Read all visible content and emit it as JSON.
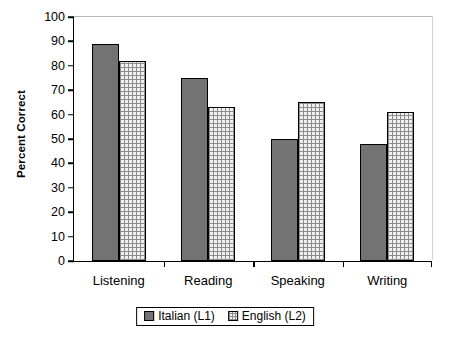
{
  "chart_data": {
    "type": "bar",
    "title": "",
    "subtitle": "",
    "xlabel": "",
    "ylabel": "Percent Correct",
    "categories": [
      "Listening",
      "Reading",
      "Speaking",
      "Writing"
    ],
    "series": [
      {
        "name": "Italian (L1)",
        "values": [
          89,
          75,
          50,
          48
        ],
        "color": "#737373",
        "pattern": "solid-gray"
      },
      {
        "name": "English (L2)",
        "values": [
          82,
          63,
          65,
          61
        ],
        "color": "#f0f0f0",
        "pattern": "cross-hatch"
      }
    ],
    "ylim": [
      0,
      100
    ],
    "ytick_step": 10,
    "ytick_labels": [
      "0",
      "10",
      "20",
      "30",
      "40",
      "50",
      "60",
      "70",
      "80",
      "90",
      "100"
    ],
    "grid": false,
    "legend_position": "bottom-center",
    "legend_boxed": true,
    "axis_color": "#000000",
    "background_color": "#ffffff"
  }
}
